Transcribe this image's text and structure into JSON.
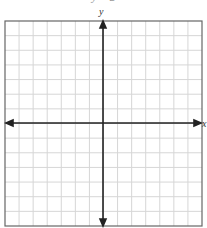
{
  "title": "y = 2",
  "axes": {
    "x_label": "x",
    "y_label": "y"
  },
  "grid": {
    "columns": 14,
    "rows": 14,
    "line_color": "#d4d4d4",
    "border_color": "#555555",
    "axis_color": "#222222"
  }
}
